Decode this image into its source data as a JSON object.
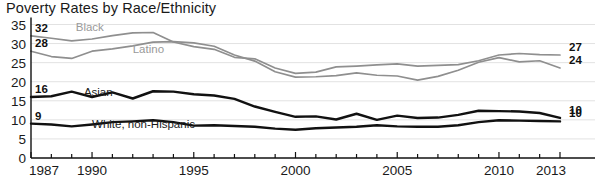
{
  "chart_data": {
    "type": "line",
    "title": "Poverty Rates by Race/Ethnicity",
    "xlabel": "",
    "ylabel": "",
    "xlim": [
      1987,
      2013
    ],
    "ylim": [
      0,
      35
    ],
    "grid": true,
    "legend_position": "inline-labels",
    "y_ticks": [
      "0",
      "5",
      "10",
      "15",
      "20",
      "25",
      "30",
      "35"
    ],
    "y_tick_values": [
      0,
      5,
      10,
      15,
      20,
      25,
      30,
      35
    ],
    "x_ticks": [
      "1987",
      "1990",
      "1995",
      "2000",
      "2005",
      "2010",
      "2013"
    ],
    "x_tick_values": [
      1987,
      1990,
      1995,
      2000,
      2005,
      2010,
      2013
    ],
    "x": [
      1987,
      1988,
      1989,
      1990,
      1991,
      1992,
      1993,
      1994,
      1995,
      1996,
      1997,
      1998,
      1999,
      2000,
      2001,
      2002,
      2003,
      2004,
      2005,
      2006,
      2007,
      2008,
      2009,
      2010,
      2011,
      2012,
      2013
    ],
    "series": [
      {
        "name": "Black",
        "color": "#8f8f8f",
        "start_label": "32",
        "end_label": "27",
        "label_x": 1989.2,
        "label_y": 33.2,
        "values": [
          32.0,
          31.4,
          30.7,
          31.2,
          32.1,
          32.8,
          32.9,
          30.4,
          29.2,
          28.5,
          26.4,
          26.0,
          23.6,
          22.2,
          22.5,
          23.9,
          24.1,
          24.4,
          24.7,
          24.1,
          24.3,
          24.5,
          25.5,
          27.0,
          27.4,
          27.1,
          27.0
        ]
      },
      {
        "name": "Latino",
        "color": "#8f8f8f",
        "start_label": "28",
        "end_label": "24",
        "label_x": 1992.0,
        "label_y": 27.4,
        "values": [
          28.0,
          26.6,
          26.1,
          28.0,
          28.6,
          29.4,
          30.4,
          30.5,
          30.2,
          29.3,
          27.0,
          25.4,
          22.6,
          21.2,
          21.3,
          21.6,
          22.3,
          21.7,
          21.5,
          20.4,
          21.4,
          23.0,
          25.1,
          26.3,
          25.2,
          25.5,
          23.6
        ]
      },
      {
        "name": "Asian",
        "color": "#111111",
        "start_label": "16",
        "end_label": "10",
        "label_x": 1989.6,
        "label_y": 16.3,
        "values": [
          16.0,
          16.2,
          17.4,
          16.0,
          17.2,
          15.6,
          17.5,
          17.4,
          16.7,
          16.4,
          15.5,
          13.5,
          12.1,
          10.8,
          10.9,
          10.1,
          11.6,
          10.0,
          11.1,
          10.5,
          10.6,
          11.3,
          12.4,
          12.3,
          12.2,
          11.8,
          10.5
        ]
      },
      {
        "name": "White, non-Hispanic",
        "color": "#111111",
        "start_label": "9",
        "end_label": "10",
        "label_x": 1990.0,
        "label_y": 7.9,
        "values": [
          9.0,
          8.8,
          8.3,
          8.8,
          9.4,
          9.6,
          9.9,
          9.4,
          8.5,
          8.6,
          8.4,
          8.2,
          7.7,
          7.4,
          7.8,
          8.0,
          8.2,
          8.6,
          8.3,
          8.2,
          8.2,
          8.6,
          9.4,
          9.9,
          9.8,
          9.7,
          9.6
        ]
      }
    ]
  },
  "axis": {
    "axis_color": "#111111",
    "grid_color": "#e2e2e2"
  }
}
